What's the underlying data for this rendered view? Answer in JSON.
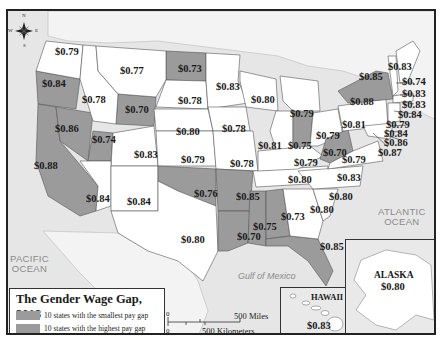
{
  "map": {
    "title": "The Gender Wage Gap, 2018",
    "colors": {
      "highlight": "#9b9b9b",
      "default_state": "#ffffff",
      "land_other": "#efefef",
      "water": "#e6e6e6",
      "border": "#555555"
    },
    "legend": {
      "title": "The Gender Wage Gap, 2018",
      "items": [
        {
          "label": "10 states with the smallest pay gap",
          "color": "#9b9b9b"
        },
        {
          "label": "10 states with the highest pay gap",
          "color": "#9b9b9b"
        }
      ]
    },
    "labels": {
      "pacific": "PACIFIC\nOCEAN",
      "atlantic": "ATLANTIC\nOCEAN",
      "gulf": "Gulf of Mexico",
      "hawaii": "HAWAII",
      "alaska": "ALASKA"
    },
    "compass": {
      "n": "N",
      "s": "S",
      "e": "E",
      "w": "W"
    },
    "scale": {
      "zero_top": "0",
      "zero_bottom": "0",
      "miles": "500 Miles",
      "km": "500 Kilometers"
    },
    "states": [
      {
        "state": "Washington",
        "value": "$0.79",
        "highlighted": false
      },
      {
        "state": "Oregon",
        "value": "$0.84",
        "highlighted": true
      },
      {
        "state": "Idaho",
        "value": "$0.78",
        "highlighted": false
      },
      {
        "state": "Montana",
        "value": "$0.77",
        "highlighted": false
      },
      {
        "state": "Wyoming",
        "value": "$0.70",
        "highlighted": true
      },
      {
        "state": "North Dakota",
        "value": "$0.73",
        "highlighted": true
      },
      {
        "state": "South Dakota",
        "value": "$0.78",
        "highlighted": false
      },
      {
        "state": "Minnesota",
        "value": "$0.83",
        "highlighted": false
      },
      {
        "state": "Wisconsin",
        "value": "$0.80",
        "highlighted": false
      },
      {
        "state": "Michigan",
        "value": "$0.79",
        "highlighted": false
      },
      {
        "state": "Nevada",
        "value": "$0.86",
        "highlighted": true
      },
      {
        "state": "Utah",
        "value": "$0.74",
        "highlighted": true
      },
      {
        "state": "California",
        "value": "$0.88",
        "highlighted": true
      },
      {
        "state": "Colorado",
        "value": "$0.83",
        "highlighted": false
      },
      {
        "state": "Nebraska",
        "value": "$0.80",
        "highlighted": false
      },
      {
        "state": "Iowa",
        "value": "$0.78",
        "highlighted": false
      },
      {
        "state": "Kansas",
        "value": "$0.79",
        "highlighted": false
      },
      {
        "state": "Missouri",
        "value": "$0.78",
        "highlighted": false
      },
      {
        "state": "Illinois",
        "value": "$0.81",
        "highlighted": false
      },
      {
        "state": "Indiana",
        "value": "$0.75",
        "highlighted": true
      },
      {
        "state": "Ohio",
        "value": "$0.79",
        "highlighted": false
      },
      {
        "state": "Arizona",
        "value": "$0.84",
        "highlighted": false
      },
      {
        "state": "New Mexico",
        "value": "$0.84",
        "highlighted": false
      },
      {
        "state": "Oklahoma",
        "value": "$0.76",
        "highlighted": true
      },
      {
        "state": "Arkansas",
        "value": "$0.85",
        "highlighted": true
      },
      {
        "state": "Texas",
        "value": "$0.80",
        "highlighted": false
      },
      {
        "state": "Kentucky",
        "value": "$0.79",
        "highlighted": false
      },
      {
        "state": "Tennessee",
        "value": "$0.80",
        "highlighted": false
      },
      {
        "state": "West Virginia",
        "value": "$0.70",
        "highlighted": true
      },
      {
        "state": "Virginia",
        "value": "$0.79",
        "highlighted": false
      },
      {
        "state": "North Carolina",
        "value": "$0.83",
        "highlighted": false
      },
      {
        "state": "South Carolina",
        "value": "$0.80",
        "highlighted": false
      },
      {
        "state": "Georgia",
        "value": "$0.80",
        "highlighted": false
      },
      {
        "state": "Alabama",
        "value": "$0.73",
        "highlighted": true
      },
      {
        "state": "Mississippi",
        "value": "$0.75",
        "highlighted": true
      },
      {
        "state": "Louisiana",
        "value": "$0.70",
        "highlighted": true
      },
      {
        "state": "Florida",
        "value": "$0.85",
        "highlighted": true
      },
      {
        "state": "Pennsylvania",
        "value": "$0.81",
        "highlighted": false
      },
      {
        "state": "New York",
        "value": "$0.88",
        "highlighted": true
      },
      {
        "state": "Vermont",
        "value": "$0.85",
        "highlighted": false
      },
      {
        "state": "Maine",
        "value": "$0.83",
        "highlighted": false
      },
      {
        "state": "New Hampshire",
        "value": "$0.74",
        "highlighted": false
      },
      {
        "state": "Massachusetts",
        "value": "$0.83",
        "highlighted": false
      },
      {
        "state": "Rhode Island",
        "value": "$0.83",
        "highlighted": false
      },
      {
        "state": "Connecticut",
        "value": "$0.84",
        "highlighted": false
      },
      {
        "state": "New Jersey",
        "value": "$0.79",
        "highlighted": false
      },
      {
        "state": "Delaware",
        "value": "$0.84",
        "highlighted": false
      },
      {
        "state": "Maryland",
        "value": "$0.86",
        "highlighted": false
      },
      {
        "state": "District of Columbia",
        "value": "$0.87",
        "highlighted": false
      },
      {
        "state": "Hawaii",
        "value": "$0.83",
        "highlighted": false
      },
      {
        "state": "Alaska",
        "value": "$0.80",
        "highlighted": false
      }
    ]
  }
}
